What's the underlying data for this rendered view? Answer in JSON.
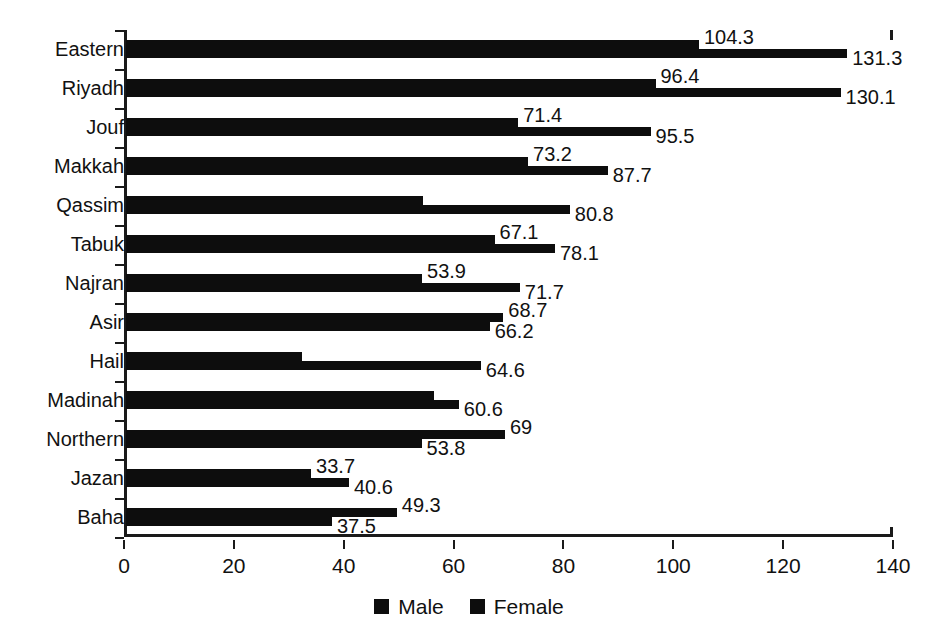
{
  "chart_data": {
    "type": "bar",
    "orientation": "horizontal",
    "title": "",
    "xlabel": "",
    "ylabel": "",
    "xlim": [
      0,
      140
    ],
    "xticks": [
      0,
      20,
      40,
      60,
      80,
      100,
      120,
      140
    ],
    "grid": false,
    "legend_position": "bottom-center",
    "categories": [
      "Eastern",
      "Riyadh",
      "Jouf",
      "Makkah",
      "Qassim",
      "Tabuk",
      "Najran",
      "Asir",
      "Hail",
      "Madinah",
      "Northern",
      "Jazan",
      "Baha"
    ],
    "series": [
      {
        "name": "Male",
        "color": "#0d0d0d",
        "values": [
          104.3,
          96.4,
          71.4,
          73.2,
          54.0,
          67.1,
          53.9,
          68.7,
          32.0,
          56.0,
          69,
          33.7,
          49.3
        ],
        "labels": [
          "104.3",
          "96.4",
          "71.4",
          "73.2",
          "",
          "67.1",
          "53.9",
          "68.7",
          "",
          "",
          "69",
          "33.7",
          "49.3"
        ]
      },
      {
        "name": "Female",
        "color": "#0d0d0d",
        "values": [
          131.3,
          130.1,
          95.5,
          87.7,
          80.8,
          78.1,
          71.7,
          66.2,
          64.6,
          60.6,
          53.8,
          40.6,
          37.5
        ],
        "labels": [
          "131.3",
          "130.1",
          "95.5",
          "87.7",
          "80.8",
          "78.1",
          "71.7",
          "66.2",
          "64.6",
          "60.6",
          "53.8",
          "40.6",
          "37.5"
        ]
      }
    ],
    "legend": [
      "Male",
      "Female"
    ]
  }
}
